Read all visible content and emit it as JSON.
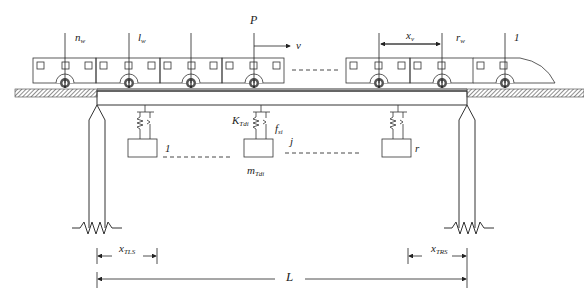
{
  "diagram": {
    "labels": {
      "load": "P",
      "velocity": "v",
      "wheel_n": {
        "main": "n",
        "sub": "w"
      },
      "wheel_l": {
        "main": "l",
        "sub": "w"
      },
      "wheel_r": {
        "main": "r",
        "sub": "w"
      },
      "first_wheel": "1",
      "vehicle_spacing": {
        "main": "x",
        "sub": "v"
      },
      "tmd_stiffness": {
        "main": "K",
        "sub": "Tdi"
      },
      "tmd_damping": {
        "main": "f",
        "sub": "si"
      },
      "tmd_mass": {
        "main": "m",
        "sub": "Tdi"
      },
      "tmd_first": "1",
      "tmd_j": "j",
      "tmd_r": "r",
      "left_offset": {
        "main": "x",
        "sub": "TLS"
      },
      "right_offset": {
        "main": "x",
        "sub": "TRS"
      },
      "span": "L"
    },
    "colors": {
      "line": "#333333",
      "hatch": "#555555",
      "background": "#ffffff"
    }
  }
}
